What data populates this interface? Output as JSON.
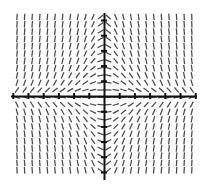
{
  "chart_data": {
    "type": "scatter",
    "subtype": "slope-field",
    "title": "",
    "subtitle": "",
    "xlabel": "",
    "ylabel": "",
    "tick_labels_x": [],
    "tick_labels_y": [],
    "legend": [],
    "annotations": [],
    "grid": false,
    "legend_position": "none",
    "xlim": [
      -6.5,
      6.5
    ],
    "ylim": [
      -5.5,
      5.5
    ],
    "slope_formula": "dy/dx = -x*y",
    "slope_scale": 0.16,
    "field": {
      "n_cols": 24,
      "n_rows": 22,
      "x_start": 17.0,
      "y_start": 17.0,
      "x_step": 7.6,
      "y_step": 7.3,
      "seg_len": 6.6,
      "color": "#4a4a4a",
      "width": 1.25
    },
    "axes": {
      "color": "#111111",
      "width": 2.0,
      "x_axis_y": 96,
      "y_axis_x": 104,
      "x_axis_from": 11,
      "x_axis_to": 197,
      "y_axis_from": 13,
      "y_axis_to": 180,
      "tick_spacing": 15.2,
      "tick_half_x": 3.0,
      "tick_half_y": 3.0,
      "tick_width": 2.0,
      "n_ticks_left": 6,
      "n_ticks_right": 6,
      "n_ticks_up": 5,
      "n_ticks_down": 5
    },
    "samples": [
      {
        "x": -6,
        "y": 4,
        "slope": 24
      },
      {
        "x": -3,
        "y": 4,
        "slope": 12
      },
      {
        "x": 0,
        "y": 4,
        "slope": 0
      },
      {
        "x": 3,
        "y": 4,
        "slope": -12
      },
      {
        "x": 6,
        "y": 4,
        "slope": -24
      },
      {
        "x": -6,
        "y": 0,
        "slope": 0
      },
      {
        "x": 6,
        "y": 0,
        "slope": 0
      },
      {
        "x": -6,
        "y": -4,
        "slope": -24
      },
      {
        "x": -3,
        "y": -4,
        "slope": -12
      },
      {
        "x": 0,
        "y": -4,
        "slope": 0
      },
      {
        "x": 3,
        "y": -4,
        "slope": 12
      },
      {
        "x": 6,
        "y": -4,
        "slope": 24
      }
    ]
  },
  "plot": {
    "background": "#ffffff",
    "canvas_name": "slope-field-canvas"
  }
}
